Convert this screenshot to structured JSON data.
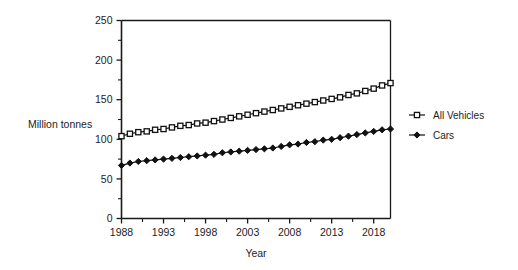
{
  "chart_data": {
    "type": "line",
    "title": "",
    "xlabel": "Year",
    "ylabel": "Million tonnes",
    "xlim": [
      1988,
      2020
    ],
    "ylim": [
      0,
      250
    ],
    "grid": false,
    "legend_position": "right",
    "xticks": [
      1988,
      1993,
      1998,
      2003,
      2008,
      2013,
      2018
    ],
    "xtick_labels": [
      "1988",
      "1993",
      "1998",
      "2003",
      "2008",
      "2013",
      "2018"
    ],
    "yticks": [
      0,
      50,
      100,
      150,
      200,
      250
    ],
    "ytick_labels": [
      "0",
      "50",
      "100",
      "150",
      "200",
      "250"
    ],
    "x": [
      1988,
      1989,
      1990,
      1991,
      1992,
      1993,
      1994,
      1995,
      1996,
      1997,
      1998,
      1999,
      2000,
      2001,
      2002,
      2003,
      2004,
      2005,
      2006,
      2007,
      2008,
      2009,
      2010,
      2011,
      2012,
      2013,
      2014,
      2015,
      2016,
      2017,
      2018,
      2019,
      2020
    ],
    "series": [
      {
        "name": "All Vehicles",
        "marker": "open-square",
        "values": [
          104,
          107,
          109,
          110,
          112,
          113,
          115,
          117,
          118,
          120,
          121,
          123,
          125,
          127,
          129,
          131,
          133,
          135,
          137,
          139,
          141,
          143,
          145,
          147,
          149,
          151,
          153,
          156,
          158,
          161,
          164,
          168,
          171
        ]
      },
      {
        "name": "Cars",
        "marker": "filled-diamond",
        "values": [
          67,
          70,
          72,
          73,
          74,
          75,
          76,
          77,
          78,
          79,
          80,
          81,
          83,
          84,
          85,
          86,
          87,
          88,
          89,
          91,
          93,
          94,
          96,
          97,
          99,
          100,
          102,
          104,
          106,
          108,
          110,
          112,
          113
        ]
      }
    ],
    "legend": [
      {
        "label": "All Vehicles",
        "marker": "open-square"
      },
      {
        "label": "Cars",
        "marker": "filled-diamond"
      }
    ],
    "colors": {
      "axis": "#1a1a1a",
      "line": "#111111",
      "background": "#ffffff"
    }
  }
}
